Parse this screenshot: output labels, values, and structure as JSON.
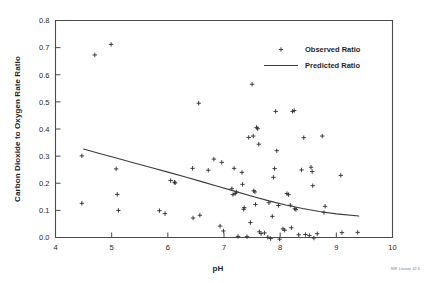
{
  "chart_data": {
    "type": "scatter",
    "title": "",
    "xlabel": "pH",
    "ylabel": "Carbon Dioxide to Oxygen Rate Ratio",
    "xlim": [
      4,
      10
    ],
    "ylim": [
      0.0,
      0.8
    ],
    "xticks": [
      "4",
      "5",
      "6",
      "7",
      "8",
      "9",
      "10"
    ],
    "xtick_values": [
      4,
      5,
      6,
      7,
      8,
      9,
      10
    ],
    "yticks": [
      "0.0",
      "0.1",
      "0.2",
      "0.3",
      "0.4",
      "0.5",
      "0.6",
      "0.7",
      "0.8"
    ],
    "ytick_values": [
      0.0,
      0.1,
      0.2,
      0.3,
      0.4,
      0.5,
      0.6,
      0.7,
      0.8
    ],
    "grid": false,
    "legend_position": "top-right",
    "legend": [
      {
        "label": "Observed Ratio",
        "marker": "plus"
      },
      {
        "label": "Predicted Ratio",
        "marker": "line"
      }
    ],
    "series": [
      {
        "name": "Observed Ratio",
        "type": "scatter",
        "marker": "plus",
        "color": "#2b2b2b",
        "points": [
          [
            4.47,
            0.301
          ],
          [
            4.47,
            0.126
          ],
          [
            4.7,
            0.673
          ],
          [
            4.99,
            0.712
          ],
          [
            5.08,
            0.253
          ],
          [
            5.1,
            0.159
          ],
          [
            5.12,
            0.1
          ],
          [
            5.85,
            0.099
          ],
          [
            5.95,
            0.088
          ],
          [
            6.05,
            0.21
          ],
          [
            6.12,
            0.204
          ],
          [
            6.13,
            0.201
          ],
          [
            6.44,
            0.255
          ],
          [
            6.45,
            0.072
          ],
          [
            6.55,
            0.495
          ],
          [
            6.57,
            0.082
          ],
          [
            6.72,
            0.248
          ],
          [
            6.82,
            0.289
          ],
          [
            6.93,
            0.042
          ],
          [
            6.96,
            0.277
          ],
          [
            6.99,
            0.024
          ],
          [
            7.14,
            0.18
          ],
          [
            7.16,
            0.158
          ],
          [
            7.18,
            0.255
          ],
          [
            7.2,
            0.162
          ],
          [
            7.22,
            0.168
          ],
          [
            7.25,
            0.004
          ],
          [
            7.32,
            0.24
          ],
          [
            7.33,
            0.196
          ],
          [
            7.35,
            0.104
          ],
          [
            7.36,
            0.11
          ],
          [
            7.41,
            0.003
          ],
          [
            7.44,
            0.369
          ],
          [
            7.47,
            0.055
          ],
          [
            7.5,
            0.565
          ],
          [
            7.52,
            0.374
          ],
          [
            7.53,
            0.172
          ],
          [
            7.55,
            0.168
          ],
          [
            7.56,
            0.122
          ],
          [
            7.58,
            0.406
          ],
          [
            7.6,
            0.401
          ],
          [
            7.62,
            0.344
          ],
          [
            7.63,
            0.021
          ],
          [
            7.66,
            0.014
          ],
          [
            7.72,
            0.017
          ],
          [
            7.78,
            0.001
          ],
          [
            7.8,
            0.128
          ],
          [
            7.83,
            -0.004
          ],
          [
            7.86,
            0.078
          ],
          [
            7.88,
            0.222
          ],
          [
            7.9,
            0.254
          ],
          [
            7.92,
            0.465
          ],
          [
            7.94,
            0.32
          ],
          [
            7.97,
            0.118
          ],
          [
            7.99,
            -0.006
          ],
          [
            8.05,
            0.032
          ],
          [
            8.08,
            0.027
          ],
          [
            8.12,
            0.162
          ],
          [
            8.15,
            0.158
          ],
          [
            8.18,
            0.119
          ],
          [
            8.2,
            0.036
          ],
          [
            8.22,
            0.465
          ],
          [
            8.25,
            0.468
          ],
          [
            8.26,
            0.106
          ],
          [
            8.28,
            0.103
          ],
          [
            8.33,
            0.01
          ],
          [
            8.38,
            0.249
          ],
          [
            8.42,
            0.368
          ],
          [
            8.45,
            0.011
          ],
          [
            8.52,
            0.007
          ],
          [
            8.55,
            0.259
          ],
          [
            8.57,
            0.243
          ],
          [
            8.58,
            0.191
          ],
          [
            8.6,
            -0.002
          ],
          [
            8.66,
            0.014
          ],
          [
            8.75,
            0.374
          ],
          [
            8.78,
            0.092
          ],
          [
            8.8,
            0.115
          ],
          [
            9.08,
            0.229
          ],
          [
            9.1,
            0.018
          ],
          [
            9.38,
            0.019
          ]
        ]
      },
      {
        "name": "Predicted Ratio",
        "type": "line",
        "color": "#3a3a3a",
        "points": [
          [
            4.5,
            0.326
          ],
          [
            4.8,
            0.309
          ],
          [
            5.1,
            0.292
          ],
          [
            5.4,
            0.275
          ],
          [
            5.7,
            0.258
          ],
          [
            6.0,
            0.241
          ],
          [
            6.3,
            0.224
          ],
          [
            6.6,
            0.206
          ],
          [
            6.9,
            0.188
          ],
          [
            7.2,
            0.17
          ],
          [
            7.5,
            0.152
          ],
          [
            7.8,
            0.135
          ],
          [
            8.1,
            0.12
          ],
          [
            8.4,
            0.107
          ],
          [
            8.7,
            0.096
          ],
          [
            9.0,
            0.087
          ],
          [
            9.4,
            0.079
          ]
        ]
      }
    ]
  },
  "credit": {
    "text": "NIR Lesson 42.6"
  }
}
